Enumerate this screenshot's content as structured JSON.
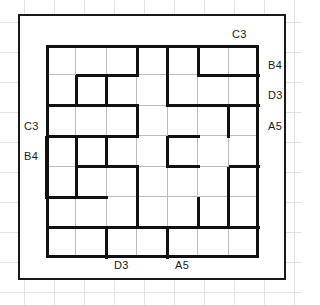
{
  "puzzle": {
    "type": "wall-maze-grid",
    "grid": {
      "rows": 7,
      "cols": 7
    },
    "labels": {
      "top": [
        {
          "text": "C3",
          "col": 6
        }
      ],
      "right": [
        {
          "text": "B4",
          "row": 0
        },
        {
          "text": "D3",
          "row": 1
        },
        {
          "text": "A5",
          "row": 2
        }
      ],
      "left": [
        {
          "text": "C3",
          "row": 2
        },
        {
          "text": "B4",
          "row": 3
        }
      ],
      "bottom": [
        {
          "text": "D3",
          "col": 2
        },
        {
          "text": "A5",
          "col": 4
        }
      ]
    },
    "label_values": {
      "top_c3": "C3",
      "right_b4": "B4",
      "right_d3": "D3",
      "right_a5": "A5",
      "left_c3": "C3",
      "left_b4": "B4",
      "bottom_d3": "D3",
      "bottom_a5": "A5"
    },
    "colors": {
      "wall": "#111111",
      "thin_grid": "#b9bcc0",
      "frame": "#1a1a1a",
      "paper_grid": "#dfe4e8",
      "background": "#ffffff"
    },
    "walls": {
      "horizontal": [
        {
          "row": 1,
          "col": 1
        },
        {
          "row": 1,
          "col": 2
        },
        {
          "row": 1,
          "col": 5
        },
        {
          "row": 1,
          "col": 6
        },
        {
          "row": 2,
          "col": 0
        },
        {
          "row": 2,
          "col": 1
        },
        {
          "row": 2,
          "col": 2
        },
        {
          "row": 2,
          "col": 4
        },
        {
          "row": 2,
          "col": 5
        },
        {
          "row": 2,
          "col": 6
        },
        {
          "row": 3,
          "col": 0
        },
        {
          "row": 3,
          "col": 1
        },
        {
          "row": 3,
          "col": 2
        },
        {
          "row": 3,
          "col": 4
        },
        {
          "row": 4,
          "col": 1
        },
        {
          "row": 4,
          "col": 2
        },
        {
          "row": 4,
          "col": 4
        },
        {
          "row": 4,
          "col": 6
        },
        {
          "row": 5,
          "col": 0
        },
        {
          "row": 5,
          "col": 1
        },
        {
          "row": 6,
          "col": 0
        },
        {
          "row": 6,
          "col": 1
        },
        {
          "row": 6,
          "col": 2
        },
        {
          "row": 6,
          "col": 3
        },
        {
          "row": 6,
          "col": 4
        },
        {
          "row": 6,
          "col": 5
        },
        {
          "row": 6,
          "col": 6
        }
      ],
      "vertical": [
        {
          "row": 0,
          "col": 3
        },
        {
          "row": 0,
          "col": 4
        },
        {
          "row": 0,
          "col": 5
        },
        {
          "row": 1,
          "col": 1
        },
        {
          "row": 1,
          "col": 2
        },
        {
          "row": 1,
          "col": 4
        },
        {
          "row": 2,
          "col": 3
        },
        {
          "row": 2,
          "col": 6
        },
        {
          "row": 3,
          "col": 0
        },
        {
          "row": 3,
          "col": 1
        },
        {
          "row": 3,
          "col": 2
        },
        {
          "row": 3,
          "col": 4
        },
        {
          "row": 4,
          "col": 0
        },
        {
          "row": 4,
          "col": 1
        },
        {
          "row": 4,
          "col": 3
        },
        {
          "row": 4,
          "col": 6
        },
        {
          "row": 5,
          "col": 3
        },
        {
          "row": 5,
          "col": 5
        },
        {
          "row": 5,
          "col": 6
        },
        {
          "row": 6,
          "col": 2
        },
        {
          "row": 6,
          "col": 4
        }
      ]
    }
  }
}
